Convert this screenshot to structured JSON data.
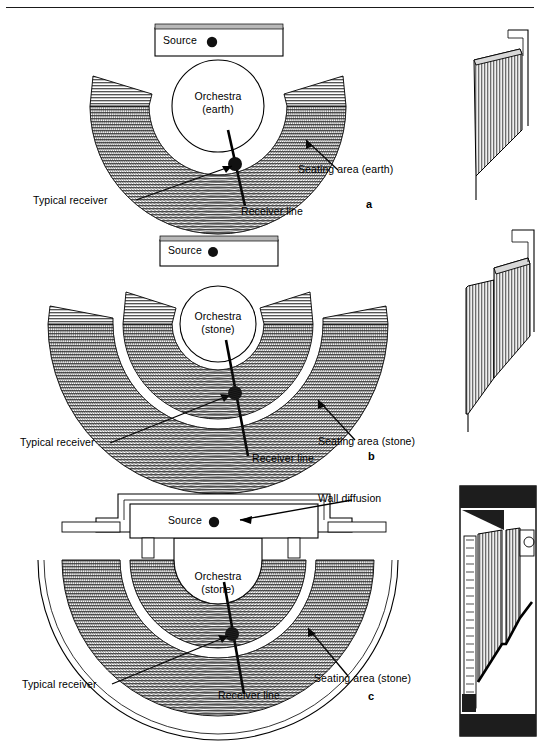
{
  "figure": {
    "type": "technical-diagram",
    "panel_count": 3,
    "top_rule": true,
    "views_per_panel": [
      "plan",
      "cross-section"
    ]
  },
  "common_labels": {
    "source": "Source",
    "typical_receiver": "Typical receiver",
    "receiver_line": "Receiver line"
  },
  "panels": [
    {
      "letter": "a",
      "orchestra_line1": "Orchestra",
      "orchestra_line2": "(earth)",
      "source": "Source",
      "seating": "Seating area (earth)",
      "typical_receiver": "Typical receiver",
      "receiver_line": "Receiver line",
      "tiers": 1,
      "has_wall_diffusion": false,
      "material": "earth"
    },
    {
      "letter": "b",
      "orchestra_line1": "Orchestra",
      "orchestra_line2": "(stone)",
      "source": "Source",
      "seating": "Seating area  (stone)",
      "typical_receiver": "Typical receiver",
      "receiver_line": "Receiver line",
      "tiers": 2,
      "has_wall_diffusion": false,
      "material": "stone"
    },
    {
      "letter": "c",
      "orchestra_line1": "Orchestra",
      "orchestra_line2": "(stone)",
      "source": "Source",
      "seating": "Seating area  (stone)",
      "typical_receiver": "Typical receiver",
      "receiver_line": "Receiver line",
      "wall_diffusion": "Wall diffusion",
      "tiers": 2,
      "has_wall_diffusion": true,
      "material": "stone"
    }
  ],
  "colors": {
    "ink": "#000000",
    "hatch": "#3a3a3a",
    "seating_gray": "#9a9a9a",
    "paper": "#ffffff"
  }
}
